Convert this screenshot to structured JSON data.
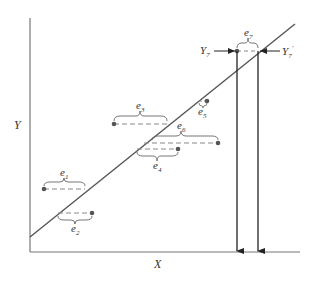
{
  "diagram": {
    "type": "regression-residuals",
    "axes": {
      "x_label": "X",
      "y_label": "Y"
    },
    "regression_line": {
      "from": [
        30,
        237
      ],
      "to": [
        295,
        24
      ]
    },
    "points": [
      {
        "id": "e1",
        "label": "e",
        "sub": "1",
        "point": [
          44,
          189
        ],
        "line_x": 85,
        "y": 189,
        "label_pos": "above"
      },
      {
        "id": "e2",
        "label": "e",
        "sub": "2",
        "point": [
          92,
          213
        ],
        "line_x": 58,
        "y": 213,
        "label_pos": "below"
      },
      {
        "id": "e3",
        "label": "e",
        "sub": "3",
        "point": [
          114,
          124
        ],
        "line_x": 167,
        "y": 124,
        "label_pos": "above"
      },
      {
        "id": "e4",
        "label": "e",
        "sub": "4",
        "point": [
          178,
          149
        ],
        "line_x": 137,
        "y": 149,
        "label_pos": "below"
      },
      {
        "id": "e5",
        "label": "e",
        "sub": "5",
        "point": [
          207,
          101
        ],
        "line_x": 199,
        "y": 101,
        "label_pos": "below"
      },
      {
        "id": "e6",
        "label": "e",
        "sub": "6",
        "point": [
          218,
          143
        ],
        "line_x": 144,
        "y": 143,
        "label_pos": "above"
      },
      {
        "id": "e7",
        "label": "e",
        "sub": "7",
        "point": [
          237,
          51
        ],
        "line_x": 258,
        "y": 51,
        "label_pos": "above"
      }
    ],
    "annotations": {
      "y7": {
        "label": "Y",
        "sub": "7",
        "prime": ""
      },
      "y7_hat": {
        "label": "Y",
        "sub": "7",
        "prime": "′"
      }
    },
    "colors": {
      "line": "#555555",
      "point": "#555555",
      "dash": "#888888",
      "axis": "#666666"
    }
  }
}
